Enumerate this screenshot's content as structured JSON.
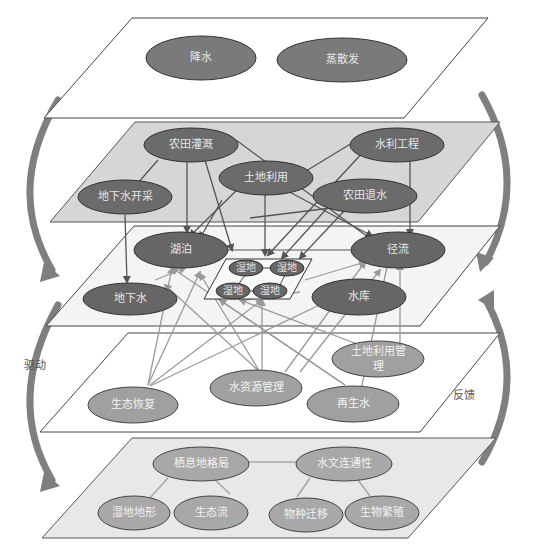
{
  "diagram": {
    "title": "",
    "side_labels": {
      "left": "驱动",
      "right": "反馈"
    },
    "colors": {
      "node_dark": "#6b6b6b",
      "node_mid": "#8a8a8a",
      "node_light": "#a8a8a8",
      "plane_white": "#ffffff",
      "plane_gray": "#d9d9d9",
      "plane_light": "#f2f2f2",
      "plane_lightgray": "#e6e6e6",
      "edge_dark": "#555555",
      "edge_light": "#9a9a9a",
      "side_arrow": "#7f7f7f"
    },
    "layers": [
      {
        "id": "climate",
        "nodes": [
          {
            "id": "precip",
            "label": "降水"
          },
          {
            "id": "evap",
            "label": "蒸散发"
          }
        ]
      },
      {
        "id": "human-activity",
        "nodes": [
          {
            "id": "irrigation",
            "label": "农田灌溉"
          },
          {
            "id": "hydro-eng",
            "label": "水利工程"
          },
          {
            "id": "landuse",
            "label": "土地利用"
          },
          {
            "id": "gw-extract",
            "label": "地下水开采"
          },
          {
            "id": "drainage",
            "label": "农田退水"
          }
        ]
      },
      {
        "id": "hydrology",
        "nodes": [
          {
            "id": "lake",
            "label": "湖泊"
          },
          {
            "id": "runoff",
            "label": "径流"
          },
          {
            "id": "groundwater",
            "label": "地下水"
          },
          {
            "id": "reservoir",
            "label": "水库"
          },
          {
            "id": "wetland1",
            "label": "湿地"
          },
          {
            "id": "wetland2",
            "label": "湿地"
          },
          {
            "id": "wetland3",
            "label": "湿地"
          },
          {
            "id": "wetland4",
            "label": "湿地"
          }
        ]
      },
      {
        "id": "management",
        "nodes": [
          {
            "id": "landuse-mgmt",
            "label": "土地利用管理"
          },
          {
            "id": "water-mgmt",
            "label": "水资源管理"
          },
          {
            "id": "eco-restore",
            "label": "生态恢复"
          },
          {
            "id": "recycled",
            "label": "再生水"
          }
        ]
      },
      {
        "id": "ecology",
        "nodes": [
          {
            "id": "habitat",
            "label": "栖息地格局"
          },
          {
            "id": "connectivity",
            "label": "水文连通性"
          },
          {
            "id": "topography",
            "label": "湿地地形"
          },
          {
            "id": "ecoflow",
            "label": "生态流"
          },
          {
            "id": "migration",
            "label": "物种迁移"
          },
          {
            "id": "reproduction",
            "label": "生物繁殖"
          }
        ]
      }
    ]
  }
}
